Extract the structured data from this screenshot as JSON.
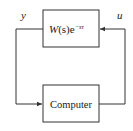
{
  "diagram": {
    "type": "block-diagram-feedback-loop",
    "blocks": [
      {
        "id": "plant",
        "label_main": "W",
        "label_paren": "(s)",
        "label_e": "e",
        "label_exp": "−sτ",
        "full_label": "W(s)e^(−sτ)"
      },
      {
        "id": "controller",
        "label": "Computer"
      }
    ],
    "signals": [
      {
        "name": "y",
        "from": "plant",
        "to": "controller"
      },
      {
        "name": "u",
        "from": "controller",
        "to": "plant"
      }
    ],
    "colors": {
      "line": "#333333",
      "text": "#222222",
      "background": "#ffffff"
    }
  }
}
